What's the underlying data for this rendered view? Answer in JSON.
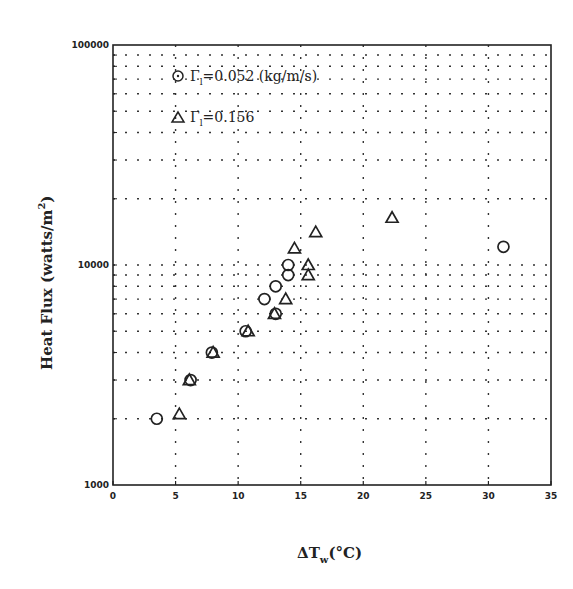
{
  "chart_data": {
    "type": "scatter",
    "title": "",
    "xlabel": "ΔT_w(°C)",
    "ylabel": "Heat Flux (watts/m²)",
    "xlim": [
      0,
      35
    ],
    "ylim": [
      1000,
      100000
    ],
    "yscale": "log",
    "grid": true,
    "x_ticks": [
      0,
      5,
      10,
      15,
      20,
      25,
      30,
      35
    ],
    "y_tick_labels": [
      "1000",
      "10000",
      "100000"
    ],
    "legend_position": "upper left",
    "series": [
      {
        "name": "Γl=0.052 (kg/m/s)",
        "marker": "circle",
        "points": [
          [
            3.5,
            2000
          ],
          [
            6.2,
            3000
          ],
          [
            7.9,
            4000
          ],
          [
            10.6,
            5000
          ],
          [
            13.0,
            6000
          ],
          [
            12.1,
            7000
          ],
          [
            13.0,
            8000
          ],
          [
            14.0,
            9000
          ],
          [
            14.0,
            10000
          ],
          [
            31.2,
            12100
          ]
        ]
      },
      {
        "name": "Γl=0.156",
        "marker": "triangle",
        "points": [
          [
            5.3,
            2100
          ],
          [
            6.1,
            3000
          ],
          [
            8.0,
            4000
          ],
          [
            10.8,
            5000
          ],
          [
            12.9,
            6000
          ],
          [
            13.8,
            7000
          ],
          [
            15.6,
            9000
          ],
          [
            15.6,
            10000
          ],
          [
            14.5,
            11900
          ],
          [
            16.2,
            14100
          ],
          [
            22.3,
            16400
          ]
        ]
      }
    ]
  },
  "axis": {
    "x_label_main": "ΔT",
    "x_label_sub": "w",
    "x_label_unit": "(°C)",
    "y_label_main": "Heat Flux (watts/m",
    "y_label_sup": "2",
    "y_label_close": ")"
  },
  "legend": {
    "entry1_symbol": "Γ",
    "entry1_sub": "l",
    "entry1_text": "=0.052 (kg/m/s)",
    "entry2_symbol": "Γ",
    "entry2_sub": "l",
    "entry2_text": "=0.156"
  }
}
